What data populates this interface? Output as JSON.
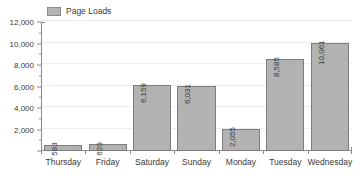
{
  "chart_data": {
    "type": "bar",
    "title": "",
    "xlabel": "",
    "ylabel": "",
    "categories": [
      "Thursday",
      "Friday",
      "Saturday",
      "Sunday",
      "Monday",
      "Tuesday",
      "Wednesday"
    ],
    "values": [
      583,
      620,
      6159,
      6031,
      2055,
      8585,
      10061
    ],
    "value_labels": [
      "583",
      "620",
      "6,159",
      "6,031",
      "2,055",
      "8,585",
      "10,061"
    ],
    "series": [
      {
        "name": "Page Loads",
        "values": [
          583,
          620,
          6159,
          6031,
          2055,
          8585,
          10061
        ],
        "color": "#b2b2b2",
        "border_color": "#7d7d7d"
      }
    ],
    "ylim": [
      0,
      12000
    ],
    "y_ticks": [
      0,
      2000,
      4000,
      6000,
      8000,
      10000,
      12000
    ],
    "y_tick_labels": [
      "",
      "2,000",
      "4,000",
      "6,000",
      "8,000",
      "10,000",
      "12,000"
    ],
    "y_minor_tick_step": 1000,
    "grid": true,
    "grid_axis": "y",
    "legend": {
      "position": "top-left",
      "entries": [
        {
          "label": "Page Loads",
          "color": "#b2b2b2"
        }
      ]
    },
    "value_labels_rotated": true,
    "background_color": "#ffffff",
    "axis_color": "#8a8a8a",
    "grid_color": "#eeeeee",
    "text_color": "#3a3a3a"
  }
}
